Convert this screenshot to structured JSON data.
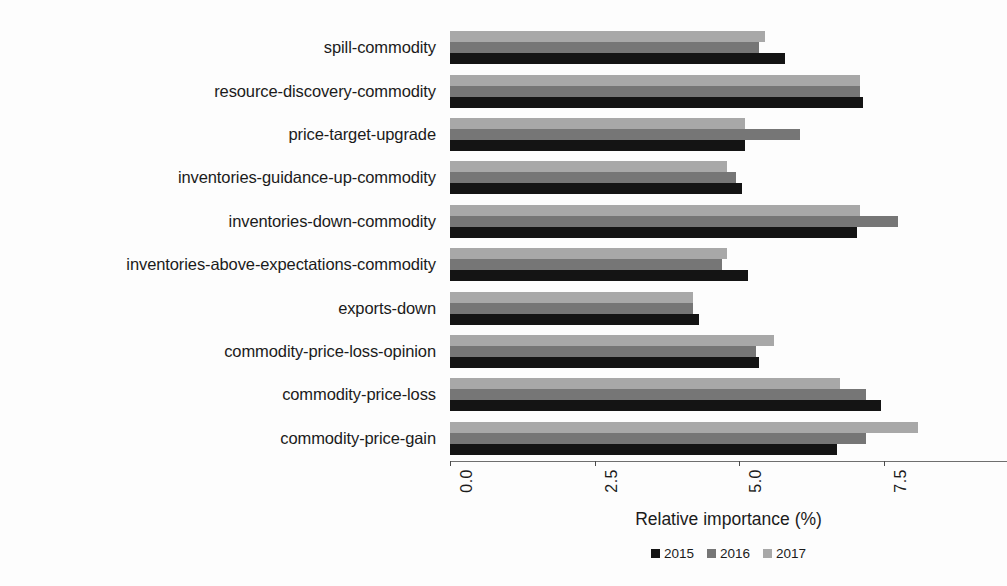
{
  "chart_data": {
    "type": "bar",
    "orientation": "horizontal",
    "title": "",
    "xlabel": "Relative importance (%)",
    "ylabel": "",
    "xlim": [
      0.0,
      9.0
    ],
    "xticks": [
      "0.0",
      "2.5",
      "5.0",
      "7.5"
    ],
    "xtick_values": [
      0.0,
      2.5,
      5.0,
      7.5
    ],
    "grid": false,
    "legend_position": "bottom-center",
    "categories": [
      "spill-commodity",
      "resource-discovery-commodity",
      "price-target-upgrade",
      "inventories-guidance-up-commodity",
      "inventories-down-commodity",
      "inventories-above-expectations-commodity",
      "exports-down",
      "commodity-price-loss-opinion",
      "commodity-price-loss",
      "commodity-price-gain"
    ],
    "series": [
      {
        "name": "2015",
        "color": "#141414",
        "values": [
          5.8,
          7.15,
          5.1,
          5.05,
          7.05,
          5.15,
          4.3,
          5.35,
          7.45,
          6.7
        ]
      },
      {
        "name": "2016",
        "color": "#767676",
        "values": [
          5.35,
          7.1,
          6.05,
          4.95,
          7.75,
          4.7,
          4.2,
          5.3,
          7.2,
          7.2
        ]
      },
      {
        "name": "2017",
        "color": "#a8a8a8",
        "values": [
          5.45,
          7.1,
          5.1,
          4.8,
          7.1,
          4.8,
          4.2,
          5.6,
          6.75,
          8.1
        ]
      }
    ],
    "series_order_top_to_bottom": [
      "2017",
      "2016",
      "2015"
    ]
  },
  "legend": {
    "items": [
      {
        "label": "2015",
        "swatch": "s2015"
      },
      {
        "label": "2016",
        "swatch": "s2016"
      },
      {
        "label": "2017",
        "swatch": "s2017"
      }
    ]
  }
}
